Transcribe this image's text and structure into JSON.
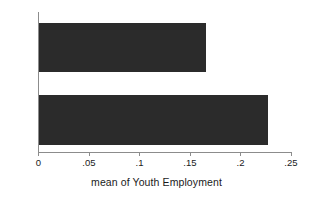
{
  "chart_data": {
    "type": "bar",
    "orientation": "horizontal",
    "title": "",
    "xlabel": "mean of Youth Employment",
    "ylabel": "",
    "categories": [
      "No",
      "Yes"
    ],
    "values": [
      0.166,
      0.227
    ],
    "series": [
      {
        "name": "mean of Youth Employment",
        "values": [
          0.166,
          0.227
        ]
      }
    ],
    "xlim": [
      0,
      0.25
    ],
    "xticks": [
      0,
      0.05,
      0.1,
      0.15,
      0.2,
      0.25
    ],
    "xticklabels": [
      "0",
      ".05",
      ".1",
      ".15",
      ".2",
      ".25"
    ],
    "grid": false,
    "legend": false,
    "bar_color": "#2b2b2b",
    "axis_color": "#8c8c8c",
    "background_color": "#ffffff"
  },
  "axis": {
    "x_title": "mean of Youth Employment",
    "tick_labels": [
      "0",
      ".05",
      ".1",
      ".15",
      ".2",
      ".25"
    ],
    "category_labels": [
      "No",
      "Yes"
    ]
  }
}
